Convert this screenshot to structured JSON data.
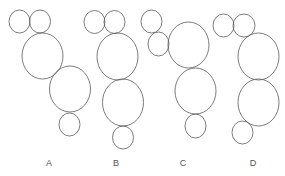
{
  "diagram": {
    "type": "circle-arrangements",
    "stroke_color": "#5a5a5a",
    "label_color": "#555555",
    "options": [
      {
        "label": "A",
        "label_pos": [
          49,
          166
        ],
        "circles": [
          {
            "cx": 19.5,
            "cy": 21.5,
            "rx": 10.5,
            "ry": 11.5,
            "size": "small"
          },
          {
            "cx": 40,
            "cy": 21.5,
            "rx": 10.5,
            "ry": 11.5,
            "size": "small"
          },
          {
            "cx": 42.5,
            "cy": 56,
            "rx": 20.5,
            "ry": 23,
            "size": "large"
          },
          {
            "cx": 70,
            "cy": 89,
            "rx": 20.5,
            "ry": 23,
            "size": "large"
          },
          {
            "cx": 69.5,
            "cy": 124.5,
            "rx": 10.5,
            "ry": 11.5,
            "size": "small"
          }
        ]
      },
      {
        "label": "B",
        "label_pos": [
          116,
          166
        ],
        "circles": [
          {
            "cx": 94.5,
            "cy": 22,
            "rx": 10.5,
            "ry": 11.5,
            "size": "small"
          },
          {
            "cx": 114.5,
            "cy": 22,
            "rx": 10.5,
            "ry": 11.5,
            "size": "small"
          },
          {
            "cx": 117.5,
            "cy": 56.5,
            "rx": 20.5,
            "ry": 23.5,
            "size": "large"
          },
          {
            "cx": 123,
            "cy": 102.5,
            "rx": 20.5,
            "ry": 23.5,
            "size": "large"
          },
          {
            "cx": 123,
            "cy": 137.5,
            "rx": 10.5,
            "ry": 11.5,
            "size": "small"
          }
        ]
      },
      {
        "label": "C",
        "label_pos": [
          183,
          166
        ],
        "circles": [
          {
            "cx": 151.5,
            "cy": 21.5,
            "rx": 10.5,
            "ry": 11.5,
            "size": "small"
          },
          {
            "cx": 158.5,
            "cy": 44,
            "rx": 10.5,
            "ry": 12,
            "size": "small"
          },
          {
            "cx": 188.5,
            "cy": 45,
            "rx": 20.5,
            "ry": 23,
            "size": "large"
          },
          {
            "cx": 195.5,
            "cy": 91,
            "rx": 20.5,
            "ry": 23,
            "size": "large"
          },
          {
            "cx": 195.5,
            "cy": 126,
            "rx": 10.5,
            "ry": 12,
            "size": "small"
          }
        ]
      },
      {
        "label": "D",
        "label_pos": [
          253,
          166
        ],
        "circles": [
          {
            "cx": 223.5,
            "cy": 25.5,
            "rx": 10.5,
            "ry": 11.5,
            "size": "small"
          },
          {
            "cx": 244,
            "cy": 25.5,
            "rx": 11,
            "ry": 11.5,
            "size": "small"
          },
          {
            "cx": 258.5,
            "cy": 56.5,
            "rx": 20.5,
            "ry": 23.5,
            "size": "large"
          },
          {
            "cx": 258.5,
            "cy": 102.5,
            "rx": 20.5,
            "ry": 23.5,
            "size": "large"
          },
          {
            "cx": 242.5,
            "cy": 132.5,
            "rx": 10.5,
            "ry": 11.5,
            "size": "small"
          }
        ]
      }
    ]
  }
}
